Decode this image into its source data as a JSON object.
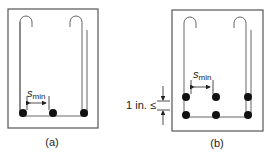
{
  "figure": {
    "panels": [
      {
        "label": "(a)",
        "spacing_symbol": "s",
        "spacing_subscript": "min",
        "bar_layers": 1,
        "bars_per_layer": 3
      },
      {
        "label": "(b)",
        "spacing_symbol": "s",
        "spacing_subscript": "min",
        "bar_layers": 2,
        "bars_per_layer": 3,
        "layer_gap_label": "1 in. ≤"
      }
    ],
    "colors": {
      "outline": "#555555",
      "stirrup": "#666666",
      "bar": "#111111",
      "text": "#222222"
    }
  }
}
